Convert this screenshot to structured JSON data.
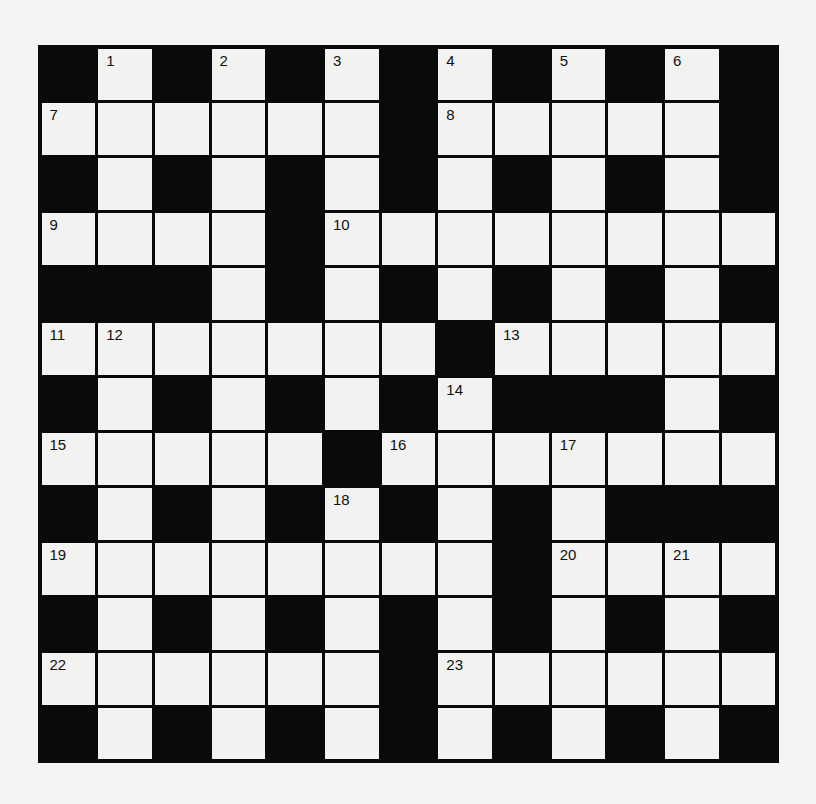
{
  "puzzle": {
    "rows": 13,
    "cols": 13,
    "colors": {
      "block": "#0a0a0a",
      "cell": "#f2f2f0",
      "background": "#f4f4f2"
    },
    "layout": [
      "BWBWBWBWBWBWB",
      "WWWWWWBWWWWWB",
      "BWBWBWBWBWBWB",
      "WWWWBWWWWWWWW",
      "BBBWBWBWBWBWB",
      "WWWWWWWBWWWWW",
      "BWBWBWBWBBBWB",
      "WWWWWBWWWWWWW",
      "BWBWBWBWBWBBB",
      "WWWWWWWWBWWWW",
      "BWBWBWBWBWBWB",
      "WWWWWWBWWWWWW",
      "BWBWBWBWBWBWB"
    ],
    "numbers": [
      {
        "r": 0,
        "c": 1,
        "n": "1"
      },
      {
        "r": 0,
        "c": 3,
        "n": "2"
      },
      {
        "r": 0,
        "c": 5,
        "n": "3"
      },
      {
        "r": 0,
        "c": 7,
        "n": "4"
      },
      {
        "r": 0,
        "c": 9,
        "n": "5"
      },
      {
        "r": 0,
        "c": 11,
        "n": "6"
      },
      {
        "r": 1,
        "c": 0,
        "n": "7"
      },
      {
        "r": 1,
        "c": 7,
        "n": "8"
      },
      {
        "r": 3,
        "c": 0,
        "n": "9"
      },
      {
        "r": 3,
        "c": 5,
        "n": "10"
      },
      {
        "r": 5,
        "c": 0,
        "n": "11"
      },
      {
        "r": 5,
        "c": 1,
        "n": "12"
      },
      {
        "r": 5,
        "c": 8,
        "n": "13"
      },
      {
        "r": 6,
        "c": 7,
        "n": "14"
      },
      {
        "r": 7,
        "c": 0,
        "n": "15"
      },
      {
        "r": 7,
        "c": 6,
        "n": "16"
      },
      {
        "r": 7,
        "c": 9,
        "n": "17"
      },
      {
        "r": 8,
        "c": 5,
        "n": "18"
      },
      {
        "r": 9,
        "c": 0,
        "n": "19"
      },
      {
        "r": 9,
        "c": 9,
        "n": "20"
      },
      {
        "r": 9,
        "c": 11,
        "n": "21"
      },
      {
        "r": 11,
        "c": 0,
        "n": "22"
      },
      {
        "r": 11,
        "c": 7,
        "n": "23"
      }
    ]
  }
}
